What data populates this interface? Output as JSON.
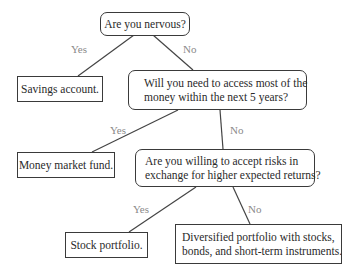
{
  "diagram": {
    "type": "decision-tree",
    "colors": {
      "border": "#3a3a3a",
      "line": "#444444",
      "text": "#2a2a2a",
      "edge_label": "#8a8a8a",
      "background": "#ffffff"
    },
    "nodes": {
      "q1": {
        "kind": "question",
        "text": "Are you nervous?"
      },
      "a1": {
        "kind": "answer",
        "text": "Savings account."
      },
      "q2": {
        "kind": "question",
        "line1": "Will you need to access most of the",
        "line2": "money within the next 5 years?"
      },
      "a2": {
        "kind": "answer",
        "text": "Money market fund."
      },
      "q3": {
        "kind": "question",
        "line1": "Are you willing to accept risks in",
        "line2": "exchange for higher expected returns?"
      },
      "a3": {
        "kind": "answer",
        "text": "Stock portfolio."
      },
      "a4": {
        "kind": "answer",
        "line1": "Diversified portfolio with stocks,",
        "line2": "bonds, and short-term instruments."
      }
    },
    "edges": [
      {
        "from": "q1",
        "to": "a1",
        "label": "Yes"
      },
      {
        "from": "q1",
        "to": "q2",
        "label": "No"
      },
      {
        "from": "q2",
        "to": "a2",
        "label": "Yes"
      },
      {
        "from": "q2",
        "to": "q3",
        "label": "No"
      },
      {
        "from": "q3",
        "to": "a3",
        "label": "Yes"
      },
      {
        "from": "q3",
        "to": "a4",
        "label": "No"
      }
    ]
  }
}
